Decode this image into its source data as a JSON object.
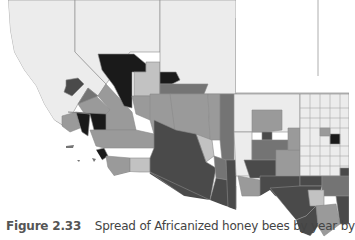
{
  "figure": {
    "label": "Figure 2.33",
    "caption": "Spread of Africanized honey bees by year by"
  },
  "map": {
    "type": "choropleth",
    "region": "Southwestern United States",
    "states_visible": [
      "California",
      "Nevada",
      "Utah",
      "Arizona",
      "New Mexico",
      "Texas"
    ],
    "color_scheme": "grayscale",
    "shades": {
      "none": "#ececec",
      "light": "#c2c2c2",
      "medium": "#9a9a9a",
      "medium_dark": "#747474",
      "dark": "#4a4a4a",
      "darkest": "#1a1a1a"
    },
    "border_color": "#8a8a8a"
  }
}
